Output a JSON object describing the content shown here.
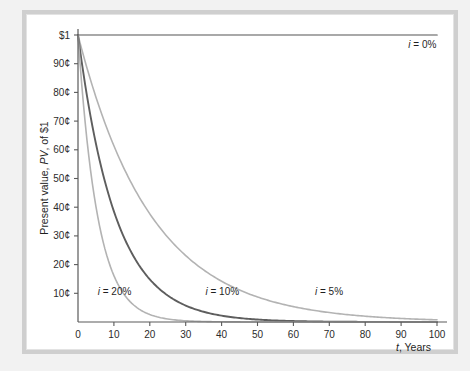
{
  "figure": {
    "background_color": "#f2f2f2",
    "panel_color": "#ffffff",
    "frame_color": "#cfcfcf"
  },
  "chart_data": {
    "type": "line",
    "title": "",
    "subtitle": "",
    "xlabel": "t, Years",
    "xlabel_italic_part": "t",
    "xlabel_rest": ", Years",
    "ylabel": "Present value, PV, of $1",
    "ylabel_part1": "Present value, ",
    "ylabel_italic": "PV",
    "ylabel_part2": ", of $1",
    "xlim": [
      0,
      100
    ],
    "ylim": [
      0,
      1
    ],
    "grid": false,
    "legend_position": "inline-annotations",
    "x_ticks": [
      0,
      10,
      20,
      30,
      40,
      50,
      60,
      70,
      80,
      90,
      100
    ],
    "x_tick_labels": [
      "0",
      "10",
      "20",
      "30",
      "40",
      "50",
      "60",
      "70",
      "80",
      "90",
      "100"
    ],
    "y_ticks": [
      0.1,
      0.2,
      0.3,
      0.4,
      0.5,
      0.6,
      0.7,
      0.8,
      0.9,
      1.0
    ],
    "y_tick_labels": [
      "10¢",
      "20¢",
      "30¢",
      "40¢",
      "50¢",
      "60¢",
      "70¢",
      "80¢",
      "90¢",
      "$1"
    ],
    "x": [
      0,
      5,
      10,
      15,
      20,
      25,
      30,
      35,
      40,
      45,
      50,
      55,
      60,
      65,
      70,
      75,
      80,
      85,
      90,
      95,
      100
    ],
    "series": [
      {
        "name": "i = 0%",
        "rate": 0.0,
        "color": "#8c8c8c",
        "label_text": "i = 0%",
        "label_italic": "i",
        "label_rest": " = 0%",
        "label_x": 92,
        "label_y": 0.955,
        "values": [
          1.0,
          1.0,
          1.0,
          1.0,
          1.0,
          1.0,
          1.0,
          1.0,
          1.0,
          1.0,
          1.0,
          1.0,
          1.0,
          1.0,
          1.0,
          1.0,
          1.0,
          1.0,
          1.0,
          1.0,
          1.0
        ]
      },
      {
        "name": "i = 5%",
        "rate": 0.05,
        "color": "#b3b3b3",
        "label_text": "i = 5%",
        "label_italic": "i",
        "label_rest": " = 5%",
        "label_x": 66,
        "label_y": 0.095,
        "values": [
          1.0,
          0.784,
          0.614,
          0.481,
          0.377,
          0.295,
          0.231,
          0.181,
          0.142,
          0.111,
          0.087,
          0.068,
          0.054,
          0.042,
          0.033,
          0.026,
          0.02,
          0.016,
          0.012,
          0.01,
          0.008
        ]
      },
      {
        "name": "i = 10%",
        "rate": 0.1,
        "color": "#5e5e5e",
        "label_text": "i = 10%",
        "label_italic": "i",
        "label_rest": " = 10%",
        "label_x": 35.5,
        "label_y": 0.095,
        "values": [
          1.0,
          0.621,
          0.386,
          0.239,
          0.149,
          0.092,
          0.057,
          0.036,
          0.022,
          0.014,
          0.0085,
          0.0053,
          0.0033,
          0.002,
          0.0013,
          0.0008,
          0.0005,
          0.0003,
          0.0002,
          0.0001,
          0.0001
        ]
      },
      {
        "name": "i = 20%",
        "rate": 0.2,
        "color": "#b3b3b3",
        "label_text": "i = 20%",
        "label_italic": "i",
        "label_rest": " = 20%",
        "label_x": 5.5,
        "label_y": 0.095,
        "values": [
          1.0,
          0.402,
          0.162,
          0.065,
          0.026,
          0.01,
          0.004,
          0.0017,
          0.0007,
          0.0003,
          0.0001,
          0.0,
          0.0,
          0.0,
          0.0,
          0.0,
          0.0,
          0.0,
          0.0,
          0.0,
          0.0
        ]
      }
    ]
  }
}
